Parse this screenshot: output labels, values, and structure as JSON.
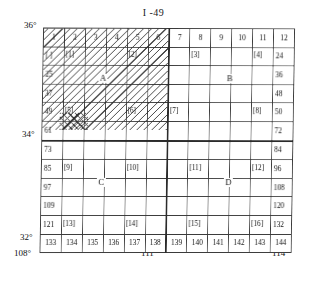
{
  "sheet": {
    "title": "I -49",
    "name": "map-index-sheet"
  },
  "axes": {
    "latitude_top": "36°",
    "latitude_mid": "34°",
    "latitude_bottom": "32°",
    "longitude_left": "108°",
    "longitude_mid": "111°",
    "longitude_right": "114°"
  },
  "quadrants": {
    "a": "A",
    "b": "B",
    "c": "C",
    "d": "D"
  },
  "header": {
    "columns": [
      "1",
      "2",
      "3",
      "4",
      "5",
      "6",
      "7",
      "8",
      "9",
      "10",
      "11",
      "12"
    ]
  },
  "rows": [
    {
      "label": "row-1",
      "cells": [
        {
          "num": "[ ]",
          "brack": ""
        },
        {
          "num": "",
          "brack": "[1]"
        },
        {
          "num": "",
          "brack": ""
        },
        {
          "num": "",
          "brack": ""
        },
        {
          "num": "",
          "brack": "[2]"
        },
        {
          "num": "",
          "brack": ""
        },
        {
          "num": "",
          "brack": ""
        },
        {
          "num": "",
          "brack": "[3]"
        },
        {
          "num": "",
          "brack": ""
        },
        {
          "num": "",
          "brack": ""
        },
        {
          "num": "",
          "brack": "[4]"
        },
        {
          "num": "24",
          "brack": ""
        }
      ]
    },
    {
      "label": "row-2",
      "cells": [
        {
          "num": "25",
          "brack": ""
        },
        {
          "num": "",
          "brack": ""
        },
        {
          "num": "",
          "brack": ""
        },
        {
          "num": "",
          "brack": ""
        },
        {
          "num": "",
          "brack": ""
        },
        {
          "num": "",
          "brack": ""
        },
        {
          "num": "",
          "brack": ""
        },
        {
          "num": "",
          "brack": ""
        },
        {
          "num": "",
          "brack": ""
        },
        {
          "num": "",
          "brack": ""
        },
        {
          "num": "",
          "brack": ""
        },
        {
          "num": "36",
          "brack": ""
        }
      ]
    },
    {
      "label": "row-3",
      "cells": [
        {
          "num": "37",
          "brack": ""
        },
        {
          "num": "",
          "brack": ""
        },
        {
          "num": "",
          "brack": ""
        },
        {
          "num": "",
          "brack": ""
        },
        {
          "num": "",
          "brack": ""
        },
        {
          "num": "",
          "brack": ""
        },
        {
          "num": "",
          "brack": ""
        },
        {
          "num": "",
          "brack": ""
        },
        {
          "num": "",
          "brack": ""
        },
        {
          "num": "",
          "brack": ""
        },
        {
          "num": "",
          "brack": ""
        },
        {
          "num": "48",
          "brack": ""
        }
      ]
    },
    {
      "label": "row-4",
      "cells": [
        {
          "num": "49",
          "brack": ""
        },
        {
          "num": "",
          "brack": "[5]"
        },
        {
          "num": "",
          "brack": ""
        },
        {
          "num": "",
          "brack": ""
        },
        {
          "num": "",
          "brack": "[6]"
        },
        {
          "num": "",
          "brack": ""
        },
        {
          "num": "",
          "brack": "[7]"
        },
        {
          "num": "",
          "brack": ""
        },
        {
          "num": "",
          "brack": ""
        },
        {
          "num": "",
          "brack": ""
        },
        {
          "num": "",
          "brack": "[8]"
        },
        {
          "num": "50",
          "brack": ""
        }
      ]
    },
    {
      "label": "row-5",
      "cells": [
        {
          "num": "61",
          "brack": ""
        },
        {
          "num": "",
          "brack": ""
        },
        {
          "num": "",
          "brack": ""
        },
        {
          "num": "",
          "brack": ""
        },
        {
          "num": "",
          "brack": ""
        },
        {
          "num": "",
          "brack": ""
        },
        {
          "num": "",
          "brack": ""
        },
        {
          "num": "",
          "brack": ""
        },
        {
          "num": "",
          "brack": ""
        },
        {
          "num": "",
          "brack": ""
        },
        {
          "num": "",
          "brack": ""
        },
        {
          "num": "72",
          "brack": ""
        }
      ]
    },
    {
      "label": "row-6",
      "cells": [
        {
          "num": "73",
          "brack": ""
        },
        {
          "num": "",
          "brack": ""
        },
        {
          "num": "",
          "brack": ""
        },
        {
          "num": "",
          "brack": ""
        },
        {
          "num": "",
          "brack": ""
        },
        {
          "num": "",
          "brack": ""
        },
        {
          "num": "",
          "brack": ""
        },
        {
          "num": "",
          "brack": ""
        },
        {
          "num": "",
          "brack": ""
        },
        {
          "num": "",
          "brack": ""
        },
        {
          "num": "",
          "brack": ""
        },
        {
          "num": "84",
          "brack": ""
        }
      ]
    },
    {
      "label": "row-7",
      "cells": [
        {
          "num": "85",
          "brack": ""
        },
        {
          "num": "",
          "brack": "[9]"
        },
        {
          "num": "",
          "brack": ""
        },
        {
          "num": "",
          "brack": ""
        },
        {
          "num": "",
          "brack": "[10]"
        },
        {
          "num": "",
          "brack": ""
        },
        {
          "num": "",
          "brack": ""
        },
        {
          "num": "",
          "brack": "[11]"
        },
        {
          "num": "",
          "brack": ""
        },
        {
          "num": "",
          "brack": ""
        },
        {
          "num": "",
          "brack": "[12]"
        },
        {
          "num": "96",
          "brack": ""
        }
      ]
    },
    {
      "label": "row-8",
      "cells": [
        {
          "num": "97",
          "brack": ""
        },
        {
          "num": "",
          "brack": ""
        },
        {
          "num": "",
          "brack": ""
        },
        {
          "num": "",
          "brack": ""
        },
        {
          "num": "",
          "brack": ""
        },
        {
          "num": "",
          "brack": ""
        },
        {
          "num": "",
          "brack": ""
        },
        {
          "num": "",
          "brack": ""
        },
        {
          "num": "",
          "brack": ""
        },
        {
          "num": "",
          "brack": ""
        },
        {
          "num": "",
          "brack": ""
        },
        {
          "num": "108",
          "brack": ""
        }
      ]
    },
    {
      "label": "row-9",
      "cells": [
        {
          "num": "109",
          "brack": ""
        },
        {
          "num": "",
          "brack": ""
        },
        {
          "num": "",
          "brack": ""
        },
        {
          "num": "",
          "brack": ""
        },
        {
          "num": "",
          "brack": ""
        },
        {
          "num": "",
          "brack": ""
        },
        {
          "num": "",
          "brack": ""
        },
        {
          "num": "",
          "brack": ""
        },
        {
          "num": "",
          "brack": ""
        },
        {
          "num": "",
          "brack": ""
        },
        {
          "num": "",
          "brack": ""
        },
        {
          "num": "120",
          "brack": ""
        }
      ]
    },
    {
      "label": "row-10",
      "cells": [
        {
          "num": "121",
          "brack": ""
        },
        {
          "num": "",
          "brack": "[13]"
        },
        {
          "num": "",
          "brack": ""
        },
        {
          "num": "",
          "brack": ""
        },
        {
          "num": "",
          "brack": "[14]"
        },
        {
          "num": "",
          "brack": ""
        },
        {
          "num": "",
          "brack": ""
        },
        {
          "num": "",
          "brack": "[15]"
        },
        {
          "num": "",
          "brack": ""
        },
        {
          "num": "",
          "brack": ""
        },
        {
          "num": "",
          "brack": "[16]"
        },
        {
          "num": "132",
          "brack": ""
        }
      ]
    },
    {
      "label": "row-11",
      "cells": [
        {
          "num": "133",
          "brack": ""
        },
        {
          "num": "134",
          "brack": ""
        },
        {
          "num": "135",
          "brack": ""
        },
        {
          "num": "136",
          "brack": ""
        },
        {
          "num": "137",
          "brack": ""
        },
        {
          "num": "138",
          "brack": ""
        },
        {
          "num": "139",
          "brack": ""
        },
        {
          "num": "140",
          "brack": ""
        },
        {
          "num": "141",
          "brack": ""
        },
        {
          "num": "142",
          "brack": ""
        },
        {
          "num": "143",
          "brack": ""
        },
        {
          "num": "144",
          "brack": ""
        }
      ]
    }
  ]
}
